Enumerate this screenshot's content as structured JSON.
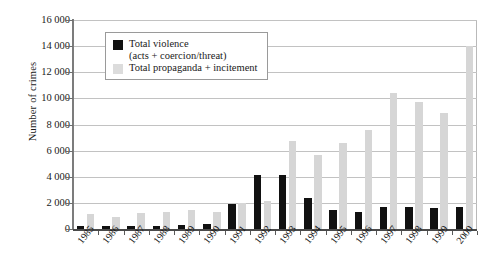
{
  "chart_data": {
    "type": "bar",
    "title": "",
    "xlabel": "",
    "ylabel": "Number of crimes",
    "ylim": [
      0,
      16000
    ],
    "ytick_step": 2000,
    "ytick_labels": [
      "16 000",
      "14 000",
      "12 000",
      "10 000",
      "8 000",
      "6 000",
      "4 000",
      "2 000",
      "0"
    ],
    "ytick_values": [
      16000,
      14000,
      12000,
      10000,
      8000,
      6000,
      4000,
      2000,
      0
    ],
    "grid": true,
    "legend_position": "top-left-inside",
    "categories": [
      "1985",
      "1986",
      "1987",
      "1988",
      "1989",
      "1990",
      "1991",
      "1992",
      "1993",
      "1994",
      "1995",
      "1996",
      "1997",
      "1998",
      "1999",
      "2000"
    ],
    "series": [
      {
        "name": "Total violence",
        "name_line2": "(acts + coercion/threat)",
        "color": "#111111",
        "values": [
          200,
          220,
          250,
          200,
          300,
          350,
          1900,
          4100,
          4100,
          2400,
          1450,
          1300,
          1650,
          1700,
          1600,
          1700
        ]
      },
      {
        "name": "Total propaganda + incitement",
        "color": "#d6d6d6",
        "values": [
          1150,
          950,
          1250,
          1300,
          1450,
          1300,
          2000,
          2150,
          6700,
          5700,
          6600,
          7600,
          10400,
          9700,
          8900,
          14000
        ]
      }
    ]
  },
  "legend": {
    "violence_label": "Total violence",
    "violence_sublabel": "(acts + coercion/threat)",
    "propaganda_label": "Total propaganda + incitement"
  },
  "axis": {
    "y_title": "Number of crimes"
  }
}
